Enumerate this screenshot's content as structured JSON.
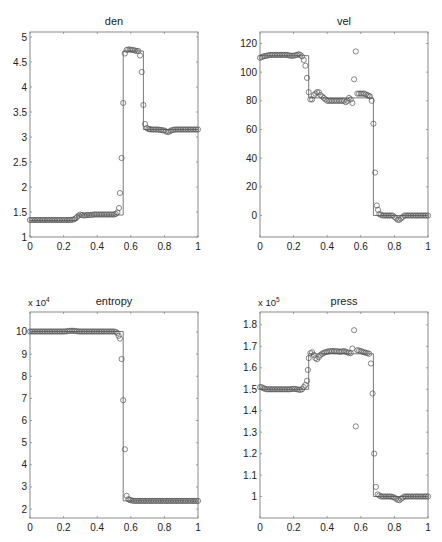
{
  "figure": {
    "panels": [
      {
        "id": "den",
        "title": "den",
        "exponent_label": "",
        "x_ticks": [
          "0",
          "0.2",
          "0.4",
          "0.6",
          "0.8",
          "1"
        ],
        "y_ticks": [
          "1",
          "1.5",
          "2",
          "2.5",
          "3",
          "3.5",
          "4",
          "4.5",
          "5"
        ]
      },
      {
        "id": "vel",
        "title": "vel",
        "exponent_label": "",
        "x_ticks": [
          "0",
          "0.2",
          "0.4",
          "0.6",
          "0.8",
          "1"
        ],
        "y_ticks": [
          "0",
          "20",
          "40",
          "60",
          "80",
          "100",
          "120"
        ]
      },
      {
        "id": "entropy",
        "title": "entropy",
        "exponent_label": "x 10^4",
        "x_ticks": [
          "0",
          "0.2",
          "0.4",
          "0.6",
          "0.8",
          "1"
        ],
        "y_ticks": [
          "2",
          "3",
          "4",
          "5",
          "6",
          "7",
          "8",
          "9",
          "10"
        ]
      },
      {
        "id": "press",
        "title": "press",
        "exponent_label": "x 10^5",
        "x_ticks": [
          "0",
          "0.2",
          "0.4",
          "0.6",
          "0.8",
          "1"
        ],
        "y_ticks": [
          "1",
          "1.1",
          "1.2",
          "1.3",
          "1.4",
          "1.5",
          "1.6",
          "1.7",
          "1.8"
        ]
      }
    ]
  },
  "chart_data": [
    {
      "type": "line",
      "title": "den",
      "xlabel": "",
      "ylabel": "",
      "xlim": [
        0,
        1
      ],
      "ylim": [
        1,
        5.1
      ],
      "grid": false,
      "frame": {
        "left": 30,
        "top": 32,
        "right": 198,
        "bottom": 237
      },
      "series": [
        {
          "name": "exact",
          "style": "line",
          "x": [
            0,
            0.28,
            0.28,
            0.555,
            0.555,
            0.675,
            0.675,
            1
          ],
          "y": [
            1.33,
            1.33,
            1.44,
            1.44,
            4.72,
            4.72,
            3.15,
            3.15
          ]
        },
        {
          "name": "numerical",
          "style": "circle",
          "x": [
            0,
            0.02,
            0.04,
            0.06,
            0.08,
            0.1,
            0.12,
            0.14,
            0.16,
            0.18,
            0.2,
            0.22,
            0.24,
            0.26,
            0.27,
            0.28,
            0.29,
            0.3,
            0.31,
            0.32,
            0.34,
            0.36,
            0.38,
            0.4,
            0.42,
            0.44,
            0.46,
            0.48,
            0.5,
            0.51,
            0.52,
            0.53,
            0.535,
            0.545,
            0.555,
            0.565,
            0.575,
            0.585,
            0.595,
            0.605,
            0.615,
            0.625,
            0.635,
            0.645,
            0.655,
            0.665,
            0.675,
            0.685,
            0.695,
            0.705,
            0.72,
            0.74,
            0.76,
            0.78,
            0.8,
            0.81,
            0.82,
            0.83,
            0.84,
            0.86,
            0.88,
            0.9,
            0.92,
            0.94,
            0.96,
            0.98,
            1
          ],
          "y": [
            1.34,
            1.34,
            1.34,
            1.34,
            1.34,
            1.34,
            1.34,
            1.34,
            1.34,
            1.34,
            1.34,
            1.34,
            1.34,
            1.35,
            1.37,
            1.4,
            1.43,
            1.45,
            1.44,
            1.43,
            1.44,
            1.44,
            1.45,
            1.45,
            1.45,
            1.45,
            1.45,
            1.45,
            1.45,
            1.46,
            1.49,
            1.58,
            1.88,
            2.58,
            3.68,
            4.67,
            4.74,
            4.75,
            4.75,
            4.74,
            4.74,
            4.73,
            4.72,
            4.72,
            4.63,
            4.3,
            3.64,
            3.26,
            3.18,
            3.16,
            3.15,
            3.15,
            3.15,
            3.14,
            3.13,
            3.11,
            3.1,
            3.11,
            3.13,
            3.15,
            3.15,
            3.15,
            3.15,
            3.15,
            3.15,
            3.15,
            3.15
          ]
        }
      ]
    },
    {
      "type": "line",
      "title": "vel",
      "xlabel": "",
      "ylabel": "",
      "xlim": [
        0,
        1
      ],
      "ylim": [
        -15,
        128
      ],
      "grid": false,
      "frame": {
        "left": 260,
        "top": 32,
        "right": 428,
        "bottom": 237
      },
      "series": [
        {
          "name": "exact",
          "style": "line",
          "x": [
            0,
            0.29,
            0.29,
            0.675,
            0.675,
            1
          ],
          "y": [
            111.5,
            111.5,
            82,
            82,
            0,
            0
          ]
        },
        {
          "name": "numerical",
          "style": "circle",
          "x": [
            0,
            0.01,
            0.02,
            0.04,
            0.06,
            0.08,
            0.1,
            0.12,
            0.14,
            0.16,
            0.18,
            0.2,
            0.22,
            0.23,
            0.24,
            0.25,
            0.26,
            0.27,
            0.28,
            0.29,
            0.3,
            0.31,
            0.32,
            0.33,
            0.34,
            0.35,
            0.36,
            0.37,
            0.38,
            0.39,
            0.4,
            0.42,
            0.44,
            0.46,
            0.48,
            0.5,
            0.51,
            0.52,
            0.53,
            0.54,
            0.55,
            0.56,
            0.57,
            0.58,
            0.59,
            0.6,
            0.62,
            0.64,
            0.655,
            0.665,
            0.675,
            0.685,
            0.695,
            0.71,
            0.73,
            0.75,
            0.77,
            0.79,
            0.8,
            0.81,
            0.82,
            0.83,
            0.84,
            0.85,
            0.86,
            0.88,
            0.9,
            0.92,
            0.94,
            0.96,
            0.98,
            1
          ],
          "y": [
            110,
            110.5,
            111,
            111.5,
            112,
            112,
            112,
            112,
            112,
            112,
            111.5,
            111.5,
            112,
            112.5,
            112,
            111,
            108.5,
            104.5,
            96,
            86,
            81,
            81,
            84,
            85,
            86,
            86,
            84,
            83,
            82,
            81,
            80,
            80,
            80,
            80,
            80,
            80,
            79,
            80,
            82,
            81,
            78.5,
            95,
            114.5,
            85,
            85,
            85,
            85,
            84,
            83,
            80,
            64,
            30,
            7,
            1,
            0,
            0,
            0,
            0,
            -1,
            -2,
            -3,
            -3,
            -2,
            -1,
            0,
            0,
            0,
            0,
            0,
            0,
            0,
            0
          ]
        }
      ]
    },
    {
      "type": "line",
      "title": "entropy",
      "xlabel": "",
      "ylabel": "",
      "y_multiplier": "x 10^4",
      "xlim": [
        0,
        1
      ],
      "ylim": [
        1.6,
        10.9
      ],
      "grid": false,
      "frame": {
        "left": 30,
        "top": 312,
        "right": 198,
        "bottom": 518
      },
      "series": [
        {
          "name": "exact",
          "style": "line",
          "x": [
            0,
            0.555,
            0.555,
            1
          ],
          "y": [
            10.02,
            10.02,
            2.37,
            2.37
          ]
        },
        {
          "name": "numerical",
          "style": "circle",
          "x": [
            0,
            0.02,
            0.04,
            0.06,
            0.08,
            0.1,
            0.12,
            0.14,
            0.16,
            0.18,
            0.2,
            0.22,
            0.24,
            0.26,
            0.28,
            0.3,
            0.32,
            0.34,
            0.36,
            0.38,
            0.4,
            0.42,
            0.44,
            0.46,
            0.48,
            0.5,
            0.51,
            0.52,
            0.535,
            0.545,
            0.555,
            0.565,
            0.575,
            0.585,
            0.6,
            0.62,
            0.64,
            0.66,
            0.68,
            0.7,
            0.72,
            0.74,
            0.76,
            0.78,
            0.8,
            0.82,
            0.84,
            0.86,
            0.88,
            0.9,
            0.92,
            0.94,
            0.96,
            0.98,
            1
          ],
          "y": [
            10.02,
            10.02,
            10.02,
            10.02,
            10.02,
            10.02,
            10.02,
            10.02,
            10.02,
            10.02,
            10.02,
            10.03,
            10.05,
            10.05,
            10.03,
            10.02,
            10.02,
            10.02,
            10.02,
            10.02,
            10.02,
            10.02,
            10.02,
            10.02,
            10.02,
            10.02,
            10.0,
            9.95,
            9.7,
            8.78,
            6.92,
            4.7,
            2.6,
            2.45,
            2.4,
            2.37,
            2.37,
            2.37,
            2.37,
            2.37,
            2.37,
            2.37,
            2.37,
            2.37,
            2.37,
            2.37,
            2.37,
            2.37,
            2.37,
            2.37,
            2.37,
            2.37,
            2.37,
            2.37,
            2.37
          ]
        }
      ]
    },
    {
      "type": "line",
      "title": "press",
      "xlabel": "",
      "ylabel": "",
      "y_multiplier": "x 10^5",
      "xlim": [
        0,
        1
      ],
      "ylim": [
        0.9,
        1.86
      ],
      "grid": false,
      "frame": {
        "left": 260,
        "top": 312,
        "right": 428,
        "bottom": 518
      },
      "series": [
        {
          "name": "exact",
          "style": "line",
          "x": [
            0,
            0.29,
            0.29,
            0.675,
            0.675,
            1
          ],
          "y": [
            1.5,
            1.5,
            1.665,
            1.665,
            1.0,
            1.0
          ]
        },
        {
          "name": "numerical",
          "style": "circle",
          "x": [
            0,
            0.01,
            0.02,
            0.04,
            0.06,
            0.08,
            0.1,
            0.12,
            0.14,
            0.16,
            0.18,
            0.2,
            0.22,
            0.24,
            0.25,
            0.26,
            0.27,
            0.28,
            0.285,
            0.29,
            0.3,
            0.31,
            0.32,
            0.33,
            0.34,
            0.35,
            0.36,
            0.38,
            0.4,
            0.42,
            0.44,
            0.46,
            0.48,
            0.5,
            0.52,
            0.54,
            0.55,
            0.56,
            0.57,
            0.58,
            0.59,
            0.6,
            0.62,
            0.64,
            0.65,
            0.66,
            0.67,
            0.68,
            0.69,
            0.7,
            0.72,
            0.74,
            0.76,
            0.78,
            0.8,
            0.81,
            0.82,
            0.83,
            0.84,
            0.86,
            0.88,
            0.9,
            0.92,
            0.94,
            0.96,
            0.98,
            1
          ],
          "y": [
            1.51,
            1.51,
            1.505,
            1.5,
            1.5,
            1.5,
            1.5,
            1.5,
            1.5,
            1.5,
            1.5,
            1.502,
            1.5,
            1.497,
            1.5,
            1.51,
            1.52,
            1.54,
            1.59,
            1.645,
            1.668,
            1.672,
            1.66,
            1.645,
            1.64,
            1.65,
            1.66,
            1.67,
            1.675,
            1.678,
            1.678,
            1.677,
            1.675,
            1.678,
            1.672,
            1.668,
            1.69,
            1.775,
            1.327,
            1.682,
            1.68,
            1.678,
            1.672,
            1.668,
            1.665,
            1.62,
            1.48,
            1.2,
            1.045,
            1.01,
            1.0,
            1.0,
            1.0,
            1.0,
            0.995,
            0.99,
            0.985,
            0.983,
            0.99,
            1.0,
            1.0,
            1.0,
            1.0,
            1.0,
            1.0,
            1.0,
            1.0
          ]
        }
      ]
    }
  ]
}
